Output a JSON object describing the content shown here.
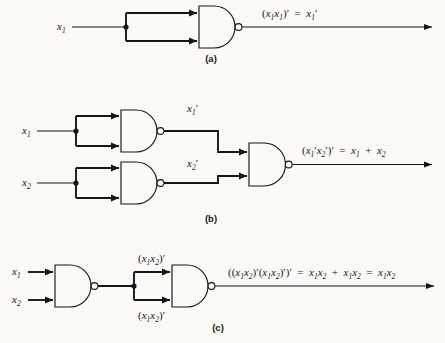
{
  "figure": {
    "background_color": "#fbfaf7",
    "ink_color": "#16161a"
  },
  "panels": [
    {
      "id": "a",
      "caption": "(a)",
      "inputs": [
        {
          "label_base": "x",
          "label_sub": "1",
          "label_prime": ""
        }
      ],
      "gates": [
        {
          "type": "nand-gate",
          "name": "nand-gate-a1",
          "inputs": 2
        }
      ],
      "output_expression": {
        "parts": [
          {
            "t": "(",
            "k": "op"
          },
          {
            "t": "x",
            "k": "v"
          },
          {
            "t": "1",
            "k": "sub"
          },
          {
            "t": "x",
            "k": "v"
          },
          {
            "t": "1",
            "k": "sub"
          },
          {
            "t": ")",
            "k": "op"
          },
          {
            "t": "′",
            "k": "prime"
          },
          {
            "t": "  =  ",
            "k": "op"
          },
          {
            "t": "x",
            "k": "v"
          },
          {
            "t": "1",
            "k": "sub"
          },
          {
            "t": "′",
            "k": "prime"
          }
        ],
        "plain": "(x1x1)' = x1'"
      }
    },
    {
      "id": "b",
      "caption": "(b)",
      "inputs": [
        {
          "label_base": "x",
          "label_sub": "1",
          "label_prime": ""
        },
        {
          "label_base": "x",
          "label_sub": "2",
          "label_prime": ""
        }
      ],
      "gates": [
        {
          "type": "nand-gate",
          "name": "nand-gate-b1",
          "inputs": 2
        },
        {
          "type": "nand-gate",
          "name": "nand-gate-b2",
          "inputs": 2
        },
        {
          "type": "nand-gate",
          "name": "nand-gate-b3",
          "inputs": 2
        }
      ],
      "intermediate_labels": [
        {
          "base": "x",
          "sub": "1",
          "prime": "′",
          "plain": "x1'"
        },
        {
          "base": "x",
          "sub": "2",
          "prime": "′",
          "plain": "x2'"
        }
      ],
      "output_expression": {
        "parts": [
          {
            "t": "(",
            "k": "op"
          },
          {
            "t": "x",
            "k": "v"
          },
          {
            "t": "1",
            "k": "sub"
          },
          {
            "t": "′",
            "k": "prime"
          },
          {
            "t": "x",
            "k": "v"
          },
          {
            "t": "2",
            "k": "sub"
          },
          {
            "t": "′",
            "k": "prime"
          },
          {
            "t": ")",
            "k": "op"
          },
          {
            "t": "′",
            "k": "prime"
          },
          {
            "t": "  =  ",
            "k": "op"
          },
          {
            "t": "x",
            "k": "v"
          },
          {
            "t": "1",
            "k": "sub"
          },
          {
            "t": "  +  ",
            "k": "op"
          },
          {
            "t": "x",
            "k": "v"
          },
          {
            "t": "2",
            "k": "sub"
          }
        ],
        "plain": "(x1'x2')' = x1 + x2"
      }
    },
    {
      "id": "c",
      "caption": "(c)",
      "inputs": [
        {
          "label_base": "x",
          "label_sub": "1",
          "label_prime": ""
        },
        {
          "label_base": "x",
          "label_sub": "2",
          "label_prime": ""
        }
      ],
      "gates": [
        {
          "type": "nand-gate",
          "name": "nand-gate-c1",
          "inputs": 2
        },
        {
          "type": "nand-gate",
          "name": "nand-gate-c2",
          "inputs": 2
        }
      ],
      "intermediate_labels": [
        {
          "plain": "(x1x2)'"
        },
        {
          "plain": "(x1x2)'"
        }
      ],
      "output_expression": {
        "plain": "((x1x2)'(x1x2)')' = x1x2 + x1x2 = x1x2"
      }
    }
  ]
}
